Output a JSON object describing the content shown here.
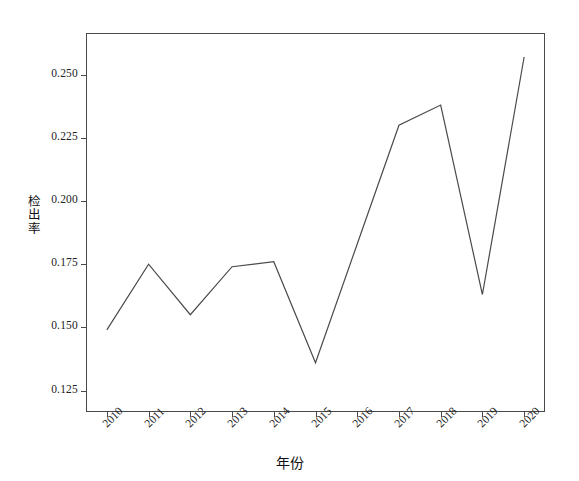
{
  "chart_data": {
    "type": "line",
    "title": "",
    "subtitle": "",
    "xlabel": "年份",
    "ylabel": "检出率",
    "x": [
      2010,
      2011,
      2012,
      2013,
      2014,
      2015,
      2016,
      2017,
      2018,
      2019,
      2020
    ],
    "categories": [
      "2010",
      "2011",
      "2012",
      "2013",
      "2014",
      "2015",
      "2016",
      "2017",
      "2018",
      "2019",
      "2020"
    ],
    "values": [
      0.149,
      0.175,
      0.155,
      0.174,
      0.176,
      0.136,
      0.183,
      0.23,
      0.238,
      0.163,
      0.257
    ],
    "series": [
      {
        "name": "检出率",
        "values": [
          0.149,
          0.175,
          0.155,
          0.174,
          0.176,
          0.136,
          0.183,
          0.23,
          0.238,
          0.163,
          0.257
        ]
      }
    ],
    "xlim": [
      2009.5,
      2020.5
    ],
    "ylim": [
      0.1165,
      0.2665
    ],
    "ytick_labels": [
      "0.125",
      "0.150",
      "0.175",
      "0.200",
      "0.225",
      "0.250"
    ],
    "ytick_values": [
      0.125,
      0.15,
      0.175,
      0.2,
      0.225,
      0.25
    ],
    "xtick_labels": [
      "2010",
      "2011",
      "2012",
      "2013",
      "2014",
      "2015",
      "2016",
      "2017",
      "2018",
      "2019",
      "2020"
    ],
    "grid": false,
    "legend": false,
    "legend_position": "none",
    "line_color": "#4a4a4a",
    "line_width": 1.2,
    "markers": false,
    "frame_color": "#4a4a4a",
    "background_color": "#ffffff",
    "xtick_label_rotation": -45
  },
  "axis": {
    "x_title": "年份",
    "y_title_chars": [
      "检",
      "出",
      "率"
    ]
  }
}
